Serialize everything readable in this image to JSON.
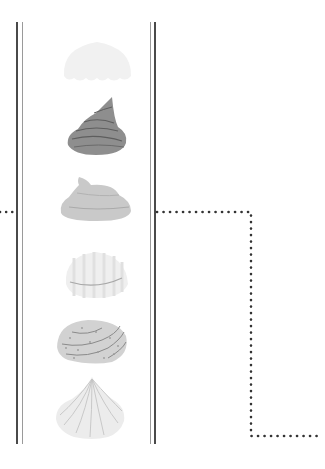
{
  "diagram": {
    "type": "frosting-tip-column",
    "items": [
      {
        "name": "cloud-frosting",
        "color": "#f0f0f0"
      },
      {
        "name": "swirl-peak-frosting",
        "color": "#8c8c8c"
      },
      {
        "name": "soft-swirl-frosting",
        "color": "#c8c8c8"
      },
      {
        "name": "striped-dome-frosting",
        "color": "#eeeeee"
      },
      {
        "name": "rosette-frosting",
        "color": "#cfcfcf"
      },
      {
        "name": "petal-fan-frosting",
        "color": "#e6e6e6"
      }
    ],
    "connector": {
      "style": "dotted",
      "color": "#333333",
      "points": [
        [
          155,
          212
        ],
        [
          251,
          212
        ],
        [
          251,
          436
        ],
        [
          323,
          436
        ]
      ]
    },
    "left_connector": {
      "style": "dotted",
      "color": "#333333",
      "y": 212
    }
  }
}
